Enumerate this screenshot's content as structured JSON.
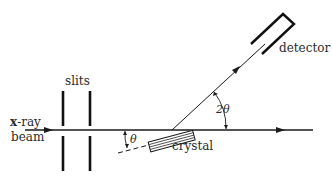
{
  "diagram": {
    "labels": {
      "slits": "slits",
      "xray_line1_bold": "x",
      "xray_line1_rest": "-ray",
      "xray_line2": "beam",
      "detector": "detector",
      "crystal": "crystal",
      "theta": "θ",
      "two_theta": "2θ"
    },
    "colors": {
      "ink": "#1a1a1a",
      "background": "#ffffff"
    }
  }
}
